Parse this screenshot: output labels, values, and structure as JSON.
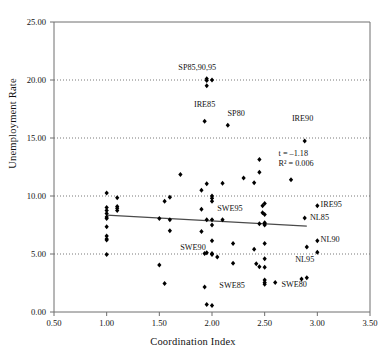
{
  "chart_data": {
    "type": "scatter",
    "title": "",
    "xlabel": "Coordination Index",
    "ylabel": "Unemployment Rate",
    "xlim": [
      0.5,
      3.5
    ],
    "ylim": [
      0.0,
      25.0
    ],
    "xticks": [
      "0.50",
      "1.00",
      "1.50",
      "2.00",
      "2.50",
      "3.00",
      "3.50"
    ],
    "xtick_values": [
      0.5,
      1.0,
      1.5,
      2.0,
      2.5,
      3.0,
      3.5
    ],
    "yticks": [
      "0.00",
      "5.00",
      "10.00",
      "15.00",
      "20.00",
      "25.00"
    ],
    "ytick_values": [
      0,
      5,
      10,
      15,
      20,
      25
    ],
    "grid": "horizontal-dotted",
    "legend": "none",
    "marker": "filled-diamond",
    "marker_color": "#000000",
    "trendline": {
      "color": "#4a4a4a",
      "x_start": 1.0,
      "y_start": 8.35,
      "x_end": 2.9,
      "y_end": 7.4
    },
    "annotations": [
      {
        "text": "t = –1.18",
        "x": 3.05,
        "y": 13.6
      },
      {
        "text": "R² = 0.006",
        "x": 3.05,
        "y": 12.75
      }
    ],
    "point_labels": [
      {
        "text": "SP85,90,95",
        "x": 1.86,
        "y": 21.0,
        "anchor": "middle"
      },
      {
        "text": "IRE85",
        "x": 1.93,
        "y": 17.8,
        "anchor": "middle"
      },
      {
        "text": "SP80",
        "x": 2.23,
        "y": 17.0,
        "anchor": "middle"
      },
      {
        "text": "IRE90",
        "x": 2.86,
        "y": 16.6,
        "anchor": "middle"
      },
      {
        "text": "IRE95",
        "x": 3.03,
        "y": 9.15,
        "anchor": "start"
      },
      {
        "text": "NL85",
        "x": 2.93,
        "y": 8.1,
        "anchor": "start"
      },
      {
        "text": "NL90",
        "x": 3.03,
        "y": 6.15,
        "anchor": "start"
      },
      {
        "text": "NL95",
        "x": 2.88,
        "y": 4.45,
        "anchor": "middle"
      },
      {
        "text": "SWE95",
        "x": 2.17,
        "y": 8.85,
        "anchor": "middle"
      },
      {
        "text": "SWE90",
        "x": 1.82,
        "y": 5.45,
        "anchor": "middle"
      },
      {
        "text": "SWE85",
        "x": 2.07,
        "y": 2.2,
        "anchor": "start"
      },
      {
        "text": "SWE80",
        "x": 2.78,
        "y": 2.3,
        "anchor": "middle"
      }
    ],
    "points": [
      {
        "x": 1.0,
        "y": 10.25
      },
      {
        "x": 1.0,
        "y": 9.0
      },
      {
        "x": 1.0,
        "y": 8.75
      },
      {
        "x": 1.0,
        "y": 8.5
      },
      {
        "x": 1.0,
        "y": 8.2
      },
      {
        "x": 1.0,
        "y": 8.05
      },
      {
        "x": 1.0,
        "y": 7.35
      },
      {
        "x": 1.0,
        "y": 6.55
      },
      {
        "x": 1.0,
        "y": 6.3
      },
      {
        "x": 1.0,
        "y": 6.2
      },
      {
        "x": 1.0,
        "y": 4.95
      },
      {
        "x": 1.1,
        "y": 9.85
      },
      {
        "x": 1.1,
        "y": 9.1
      },
      {
        "x": 1.1,
        "y": 8.95
      },
      {
        "x": 1.1,
        "y": 8.75
      },
      {
        "x": 1.5,
        "y": 8.05
      },
      {
        "x": 1.5,
        "y": 4.05
      },
      {
        "x": 1.55,
        "y": 9.55
      },
      {
        "x": 1.55,
        "y": 2.45
      },
      {
        "x": 1.6,
        "y": 9.9
      },
      {
        "x": 1.6,
        "y": 7.95
      },
      {
        "x": 1.6,
        "y": 7.0
      },
      {
        "x": 1.7,
        "y": 11.85
      },
      {
        "x": 1.9,
        "y": 10.5
      },
      {
        "x": 1.9,
        "y": 8.85
      },
      {
        "x": 1.9,
        "y": 6.95
      },
      {
        "x": 1.93,
        "y": 16.45
      },
      {
        "x": 1.93,
        "y": 5.05
      },
      {
        "x": 1.93,
        "y": 2.15
      },
      {
        "x": 1.95,
        "y": 19.95
      },
      {
        "x": 1.95,
        "y": 20.1
      },
      {
        "x": 1.95,
        "y": 19.5
      },
      {
        "x": 1.95,
        "y": 11.05
      },
      {
        "x": 1.95,
        "y": 7.95
      },
      {
        "x": 1.95,
        "y": 5.1
      },
      {
        "x": 1.95,
        "y": 0.65
      },
      {
        "x": 2.0,
        "y": 20.0
      },
      {
        "x": 2.0,
        "y": 10.0
      },
      {
        "x": 2.0,
        "y": 9.8
      },
      {
        "x": 2.0,
        "y": 9.55
      },
      {
        "x": 2.0,
        "y": 7.95
      },
      {
        "x": 2.0,
        "y": 7.5
      },
      {
        "x": 2.0,
        "y": 6.15
      },
      {
        "x": 2.0,
        "y": 5.05
      },
      {
        "x": 2.0,
        "y": 4.95
      },
      {
        "x": 2.0,
        "y": 0.55
      },
      {
        "x": 2.05,
        "y": 4.75
      },
      {
        "x": 2.1,
        "y": 11.1
      },
      {
        "x": 2.1,
        "y": 7.95
      },
      {
        "x": 2.15,
        "y": 16.1
      },
      {
        "x": 2.2,
        "y": 5.9
      },
      {
        "x": 2.2,
        "y": 4.2
      },
      {
        "x": 2.3,
        "y": 11.55
      },
      {
        "x": 2.4,
        "y": 11.15
      },
      {
        "x": 2.4,
        "y": 5.4
      },
      {
        "x": 2.42,
        "y": 4.15
      },
      {
        "x": 2.45,
        "y": 12.05
      },
      {
        "x": 2.45,
        "y": 3.9
      },
      {
        "x": 2.45,
        "y": 13.15
      },
      {
        "x": 2.48,
        "y": 9.15
      },
      {
        "x": 2.48,
        "y": 8.55
      },
      {
        "x": 2.5,
        "y": 9.35
      },
      {
        "x": 2.5,
        "y": 8.4
      },
      {
        "x": 2.5,
        "y": 7.7
      },
      {
        "x": 2.5,
        "y": 7.6
      },
      {
        "x": 2.5,
        "y": 7.5
      },
      {
        "x": 2.5,
        "y": 5.9
      },
      {
        "x": 2.5,
        "y": 4.6
      },
      {
        "x": 2.5,
        "y": 3.85
      },
      {
        "x": 2.5,
        "y": 2.75
      },
      {
        "x": 2.5,
        "y": 2.55
      },
      {
        "x": 2.5,
        "y": 2.4
      },
      {
        "x": 2.45,
        "y": 7.6
      },
      {
        "x": 2.6,
        "y": 2.55
      },
      {
        "x": 2.75,
        "y": 11.4
      },
      {
        "x": 2.85,
        "y": 2.85
      },
      {
        "x": 2.88,
        "y": 14.75
      },
      {
        "x": 2.88,
        "y": 8.1
      },
      {
        "x": 2.9,
        "y": 5.6
      },
      {
        "x": 2.9,
        "y": 2.95
      },
      {
        "x": 3.0,
        "y": 9.15
      },
      {
        "x": 3.0,
        "y": 6.15
      },
      {
        "x": 3.0,
        "y": 5.15
      }
    ]
  }
}
